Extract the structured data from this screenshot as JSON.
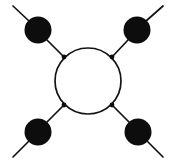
{
  "figure": {
    "title": "",
    "background_color": "#ffffff",
    "ink_color": "#131313",
    "width": 176,
    "height": 164
  },
  "chart_data": {
    "type": "diagram",
    "subtype": "feynman-loop-diagram",
    "title": "",
    "loop": {
      "name": "central-loop",
      "cx": 88,
      "cy": 81,
      "r": 33,
      "stroke_width": 1.7,
      "fill": "none"
    },
    "vertices": [
      {
        "id": "v-top-left",
        "label": "",
        "cx": 38,
        "cy": 30,
        "r": 13.5,
        "color": "#0d0d0d"
      },
      {
        "id": "v-top-right",
        "label": "",
        "cx": 137,
        "cy": 30,
        "r": 13.5,
        "color": "#0d0d0d"
      },
      {
        "id": "v-bottom-left",
        "label": "",
        "cx": 38,
        "cy": 132,
        "r": 13.5,
        "color": "#0d0d0d"
      },
      {
        "id": "v-bottom-right",
        "label": "",
        "cx": 138,
        "cy": 132,
        "r": 13.5,
        "color": "#0d0d0d"
      }
    ],
    "junctions": [
      {
        "id": "j-top-left",
        "cx": 64,
        "cy": 57,
        "r": 2.4,
        "color": "#0d0d0d"
      },
      {
        "id": "j-top-right",
        "cx": 112,
        "cy": 57,
        "r": 2.4,
        "color": "#0d0d0d"
      },
      {
        "id": "j-bottom-left",
        "cx": 64,
        "cy": 105,
        "r": 2.4,
        "color": "#0d0d0d"
      },
      {
        "id": "j-bottom-right",
        "cx": 112,
        "cy": 105,
        "r": 2.4,
        "color": "#0d0d0d"
      }
    ],
    "internal_edges": [
      {
        "id": "e-tl",
        "from": "v-top-left",
        "to": "j-top-left",
        "x1": 47,
        "y1": 40,
        "x2": 64,
        "y2": 57
      },
      {
        "id": "e-tr",
        "from": "v-top-right",
        "to": "j-top-right",
        "x1": 128,
        "y1": 40,
        "x2": 112,
        "y2": 57
      },
      {
        "id": "e-bl",
        "from": "v-bottom-left",
        "to": "j-bottom-left",
        "x1": 47,
        "y1": 122,
        "x2": 64,
        "y2": 105
      },
      {
        "id": "e-br",
        "from": "v-bottom-right",
        "to": "j-bottom-right",
        "x1": 129,
        "y1": 122,
        "x2": 112,
        "y2": 105
      }
    ],
    "external_edges": [
      {
        "id": "x-tl",
        "from": "v-top-left",
        "x1": 29,
        "y1": 21,
        "x2": 13,
        "y2": 6
      },
      {
        "id": "x-tr",
        "from": "v-top-right",
        "x1": 146,
        "y1": 21,
        "x2": 163,
        "y2": 6
      },
      {
        "id": "x-bl",
        "from": "v-bottom-left",
        "x1": 29,
        "y1": 141,
        "x2": 13,
        "y2": 157
      },
      {
        "id": "x-br",
        "from": "v-bottom-right",
        "x1": 147,
        "y1": 141,
        "x2": 163,
        "y2": 157
      }
    ],
    "counts": {
      "vertices": 4,
      "junctions": 4,
      "internal_edges": 4,
      "external_edges": 4,
      "loops": 1
    }
  }
}
